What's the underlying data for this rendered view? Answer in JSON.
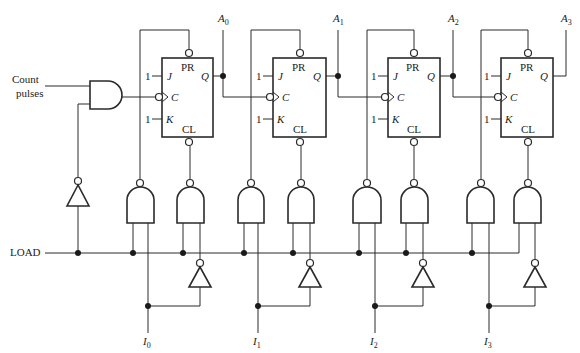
{
  "diagram": {
    "type": "4-bit binary counter with parallel load using JK flip-flops with asynchronous preset/clear",
    "inputs": {
      "count_pulses": "Count pulses",
      "load": "LOAD",
      "data_inputs": [
        "I",
        "I",
        "I",
        "I"
      ],
      "data_subscripts": [
        "0",
        "1",
        "2",
        "3"
      ]
    },
    "outputs": {
      "names": [
        "A",
        "A",
        "A",
        "A"
      ],
      "subscripts": [
        "0",
        "1",
        "2",
        "3"
      ]
    },
    "flip_flop_labels": {
      "preset": "PR",
      "clear": "CL",
      "j": "J",
      "k": "K",
      "clock": "C",
      "q": "Q",
      "j_const": "1",
      "k_const": "1"
    },
    "components": {
      "flip_flops": 4,
      "nand_gates": 8,
      "inverters": 5,
      "and_gates": 1
    }
  }
}
